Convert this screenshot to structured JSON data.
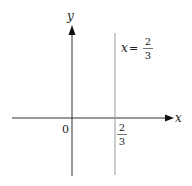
{
  "diagram": {
    "axes": {
      "x_label": "x",
      "y_label": "y",
      "origin_label": "0"
    },
    "vertical_line": {
      "equation_lhs": "x",
      "equation_eq": "=",
      "numerator": "2",
      "denominator": "3"
    },
    "x_tick": {
      "numerator": "2",
      "denominator": "3"
    },
    "colors": {
      "axis": "#222222",
      "vertical_line": "#999999"
    }
  }
}
